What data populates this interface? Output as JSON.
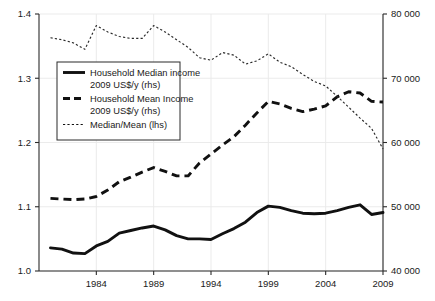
{
  "chart_data": {
    "type": "line",
    "title": "",
    "xlabel": "",
    "ylabel_left": "Median/Mean (lhs)",
    "ylabel_right": "2009 US$/y (rhs)",
    "x": [
      1980,
      1981,
      1982,
      1983,
      1984,
      1985,
      1986,
      1987,
      1988,
      1989,
      1990,
      1991,
      1992,
      1993,
      1994,
      1995,
      1996,
      1997,
      1998,
      1999,
      2000,
      2001,
      2002,
      2003,
      2004,
      2005,
      2006,
      2007,
      2008,
      2009
    ],
    "xlim": [
      1979,
      2009
    ],
    "xticks": [
      1984,
      1989,
      1994,
      1999,
      2004,
      2009
    ],
    "xtick_labels": [
      "1984",
      "1989",
      "1994",
      "1999",
      "2004",
      "2009"
    ],
    "ylim_left": [
      1.0,
      1.4
    ],
    "yticks_left": [
      1.0,
      1.1,
      1.2,
      1.3,
      1.4
    ],
    "ytick_labels_left": [
      "1.0",
      "1.1",
      "1.2",
      "1.3",
      "1.4"
    ],
    "ylim_right": [
      40000,
      80000
    ],
    "yticks_right": [
      40000,
      50000,
      60000,
      70000,
      80000
    ],
    "ytick_labels_right": [
      "40 000",
      "50 000",
      "60 000",
      "70 000",
      "80 000"
    ],
    "grid": true,
    "legend_position": "upper-left",
    "series": [
      {
        "name": "Household Median income 2009 US$/y (rhs)",
        "axis": "right",
        "style": "solid",
        "color": "#111111",
        "values": [
          43600,
          43400,
          42800,
          42700,
          43900,
          44600,
          45900,
          46300,
          46700,
          47000,
          46400,
          45500,
          45000,
          45000,
          44900,
          45800,
          46600,
          47600,
          49100,
          50100,
          49900,
          49400,
          49000,
          48900,
          49000,
          49400,
          49900,
          50300,
          48800,
          49100
        ]
      },
      {
        "name": "Household Mean Income 2009 US$/y (rhs)",
        "axis": "right",
        "style": "dashed",
        "color": "#111111",
        "values": [
          51300,
          51200,
          51100,
          51200,
          51600,
          52600,
          53900,
          54600,
          55400,
          56100,
          55500,
          54800,
          54800,
          56800,
          58200,
          59600,
          60900,
          62700,
          64600,
          66400,
          66000,
          65300,
          64800,
          65200,
          65700,
          67100,
          67900,
          67700,
          66400,
          66300
        ]
      },
      {
        "name": "Median/Mean (lhs)",
        "axis": "left",
        "style": "dotted",
        "color": "#2a2a2a",
        "values": [
          1.363,
          1.36,
          1.355,
          1.345,
          1.382,
          1.372,
          1.365,
          1.362,
          1.362,
          1.382,
          1.372,
          1.36,
          1.348,
          1.332,
          1.328,
          1.34,
          1.336,
          1.322,
          1.327,
          1.338,
          1.325,
          1.318,
          1.306,
          1.295,
          1.288,
          1.272,
          1.255,
          1.238,
          1.222,
          1.19
        ]
      }
    ],
    "legend": [
      {
        "label_line1": "Household Median income",
        "label_line2": "2009 US$/y (rhs)",
        "style": "solid"
      },
      {
        "label_line1": "Household Mean Income",
        "label_line2": "2009 US$/y (rhs)",
        "style": "dashed"
      },
      {
        "label_line1": "Median/Mean (lhs)",
        "label_line2": "",
        "style": "dotted"
      }
    ]
  },
  "plot": {
    "left": 39,
    "right": 383,
    "top": 14,
    "bottom": 271,
    "legend_rect": {
      "x": 57,
      "y": 62,
      "w": 123,
      "h": 78
    }
  }
}
